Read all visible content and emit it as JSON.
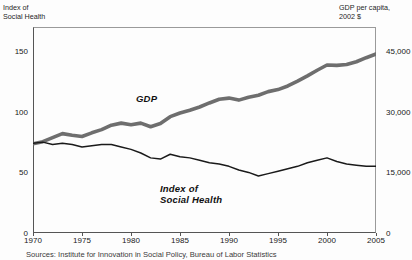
{
  "axes": {
    "left_title": "Index of\nSocial Health",
    "right_title": "GDP per capita,\n2002 $",
    "left_ticks": [
      "150",
      "100",
      "50",
      "0"
    ],
    "right_ticks": [
      "45,000",
      "30,000",
      "15,000",
      "0"
    ],
    "x_ticks": [
      "1970",
      "1975",
      "1980",
      "1985",
      "1990",
      "1995",
      "2000",
      "2005"
    ]
  },
  "series_labels": {
    "gdp": "GDP",
    "index": "Index of\nSocial Health"
  },
  "source_note": "Sources: Institute for Innovation in Social Policy, Bureau of Labor Statistics",
  "colors": {
    "gdp_line": "#6e6e6e",
    "index_line": "#1a1a1a",
    "frame": "#555555",
    "text": "#1c1c1c"
  },
  "chart_data": {
    "type": "line",
    "title": "",
    "xlabel": "",
    "ylabel": "Index of Social Health",
    "y2label": "GDP per capita, 2002 $",
    "xlim": [
      1970,
      2005
    ],
    "ylim": [
      0,
      170
    ],
    "y2lim": [
      0,
      51000
    ],
    "yticks": [
      0,
      50,
      100,
      150
    ],
    "y2ticks": [
      0,
      15000,
      30000,
      45000
    ],
    "xticks": [
      1970,
      1975,
      1980,
      1985,
      1990,
      1995,
      2000,
      2005
    ],
    "grid": false,
    "legend": "inline-labels",
    "x": [
      1970,
      1971,
      1972,
      1973,
      1974,
      1975,
      1976,
      1977,
      1978,
      1979,
      1980,
      1981,
      1982,
      1983,
      1984,
      1985,
      1986,
      1987,
      1988,
      1989,
      1990,
      1991,
      1992,
      1993,
      1994,
      1995,
      1996,
      1997,
      1998,
      1999,
      2000,
      2001,
      2002,
      2003,
      2004,
      2005
    ],
    "series": [
      {
        "name": "GDP",
        "axis": "right",
        "units": "2002 dollars per capita",
        "values": [
          22100,
          22600,
          23600,
          24600,
          24200,
          23900,
          24800,
          25600,
          26700,
          27200,
          26800,
          27200,
          26300,
          27100,
          28800,
          29700,
          30400,
          31200,
          32200,
          33100,
          33400,
          32900,
          33600,
          34100,
          35000,
          35500,
          36400,
          37600,
          38900,
          40300,
          41600,
          41500,
          41700,
          42400,
          43400,
          44300
        ]
      },
      {
        "name": "Index of Social Health",
        "axis": "left",
        "units": "index points",
        "values": [
          74,
          75,
          73,
          74,
          73,
          71,
          72,
          73,
          73,
          71,
          69,
          66,
          62,
          61,
          65,
          63,
          62,
          60,
          58,
          57,
          55,
          52,
          50,
          47,
          49,
          51,
          53,
          55,
          58,
          60,
          62,
          59,
          57,
          56,
          55,
          55
        ]
      }
    ],
    "annotations": [
      {
        "text": "GDP",
        "x": 1983,
        "y_axis": "right",
        "note": "inline series label"
      },
      {
        "text": "Index of Social Health",
        "x": 1986,
        "y_axis": "left",
        "note": "inline series label"
      }
    ]
  }
}
